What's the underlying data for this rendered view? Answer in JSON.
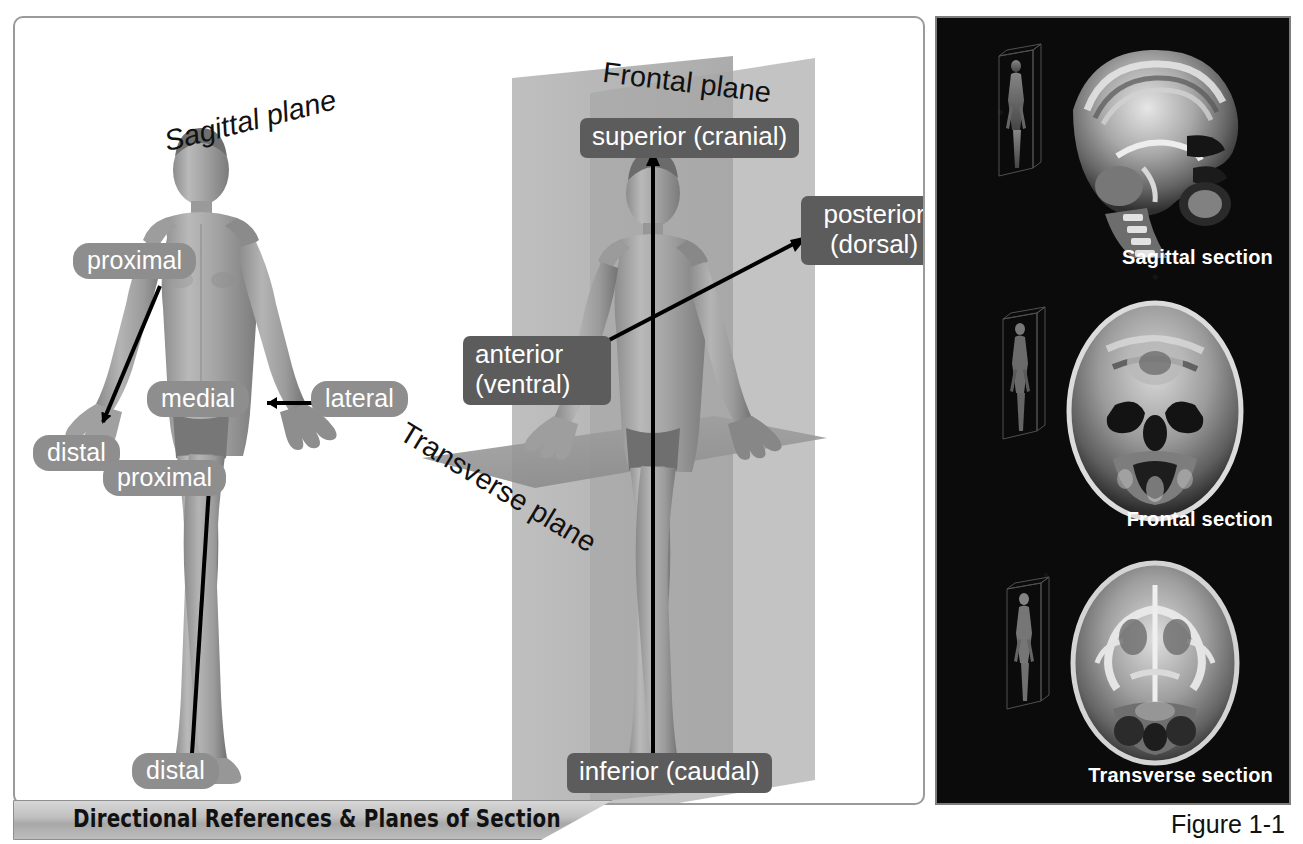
{
  "figure": {
    "caption": "Directional References & Planes of Section",
    "number": "Figure 1-1"
  },
  "left_panel": {
    "name": "directional-references-illustration",
    "labels": [
      {
        "id": "proximal-upper",
        "text": "proximal"
      },
      {
        "id": "medial",
        "text": "medial"
      },
      {
        "id": "lateral",
        "text": "lateral"
      },
      {
        "id": "distal-hand",
        "text": "distal"
      },
      {
        "id": "proximal-lower",
        "text": "proximal"
      },
      {
        "id": "distal-foot",
        "text": "distal"
      }
    ]
  },
  "center_panel": {
    "name": "planes-of-section-illustration",
    "planes": [
      {
        "id": "sagittal-plane",
        "text": "Sagittal plane"
      },
      {
        "id": "frontal-plane",
        "text": "Frontal plane"
      },
      {
        "id": "transverse-plane",
        "text": "Transverse plane"
      }
    ],
    "directions": [
      {
        "id": "superior",
        "text": "superior (cranial)"
      },
      {
        "id": "inferior",
        "text": "inferior (caudal)"
      },
      {
        "id": "posterior-line1",
        "text": "posterior"
      },
      {
        "id": "posterior-line2",
        "text": "(dorsal)"
      },
      {
        "id": "anterior-line1",
        "text": "anterior"
      },
      {
        "id": "anterior-line2",
        "text": "(ventral)"
      }
    ]
  },
  "right_panel": {
    "name": "mri-sections-panel",
    "sections": [
      {
        "id": "sagittal-section",
        "caption": "Sagittal section"
      },
      {
        "id": "frontal-section",
        "caption": "Frontal section"
      },
      {
        "id": "transverse-section",
        "caption": "Transverse section"
      }
    ]
  },
  "colors": {
    "pill_gray": "#8e8e8e",
    "box_gray": "#5c5c5c",
    "panel_border": "#9a9a9a",
    "mri_background": "#0b0b0b",
    "banner_gray": "#c0c0c0"
  }
}
